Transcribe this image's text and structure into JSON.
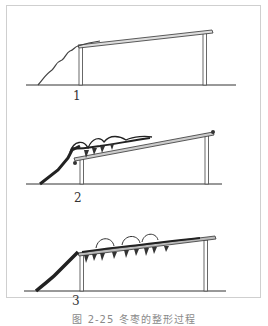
{
  "figure": {
    "caption": "图 2-25  冬枣的整形过程",
    "panels": [
      {
        "label": "1",
        "stage": "young vine climbing to trellis"
      },
      {
        "label": "2",
        "stage": "vine spreading along trellis with first clusters"
      },
      {
        "label": "3",
        "stage": "vine covering trellis with hanging clusters"
      }
    ],
    "colors": {
      "ink": "#222222",
      "frame": "#cfcfcf",
      "caption": "#8a8a8a",
      "post": "#6e6e6e"
    }
  }
}
